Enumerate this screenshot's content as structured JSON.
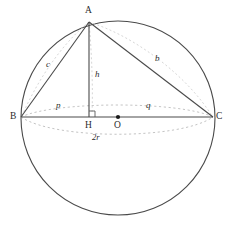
{
  "figure": {
    "kind": "geometry-diagram",
    "colors": {
      "solid_stroke": "#4a4a4a",
      "dashed_stroke": "#b9b9b9",
      "label_text": "#2b2b2b",
      "background": "#ffffff",
      "center_dot": "#1a1a1a"
    }
  },
  "vertices": [
    {
      "id": "A",
      "label": "A",
      "x": 89,
      "y": 22
    },
    {
      "id": "B",
      "label": "B",
      "x": 21,
      "y": 117
    },
    {
      "id": "C",
      "label": "C",
      "x": 213,
      "y": 117
    },
    {
      "id": "H",
      "label": "H",
      "x": 89,
      "y": 117
    },
    {
      "id": "O",
      "label": "O",
      "x": 118,
      "y": 117
    }
  ],
  "labels": {
    "A": "A",
    "B": "B",
    "C": "C",
    "H": "H",
    "O": "O",
    "c": "c",
    "b": "b",
    "h": "h",
    "p": "p",
    "q": "q",
    "diameter": "2r"
  },
  "geometry": {
    "circle": {
      "cx": 118,
      "cy": 118,
      "r": 97
    },
    "segments": [
      {
        "name": "BC",
        "from": "B",
        "to": "C",
        "style": "solid",
        "label": "2r"
      },
      {
        "name": "AB",
        "from": "A",
        "to": "B",
        "style": "solid",
        "label": "c"
      },
      {
        "name": "AC",
        "from": "A",
        "to": "C",
        "style": "solid",
        "label": "b"
      },
      {
        "name": "AH",
        "from": "A",
        "to": "H",
        "style": "solid",
        "label": "h"
      },
      {
        "name": "BH",
        "from": "B",
        "to": "H",
        "style": "dashed-arc",
        "label": "p"
      },
      {
        "name": "HC",
        "from": "H",
        "to": "C",
        "style": "dashed-arc",
        "label": "q"
      }
    ],
    "right_angle_at": "H",
    "center_marker": "O"
  }
}
